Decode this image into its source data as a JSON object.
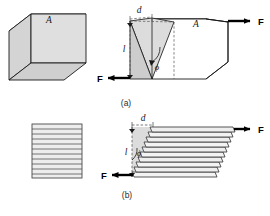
{
  "figure": {
    "background_color": "#ffffff",
    "line_color": "#1a1a1a",
    "face_fill_light": "#e8e8e8",
    "face_fill_mid": "#dedede",
    "face_fill_dark": "#d0d0d0",
    "face_fill_white": "#ffffff",
    "dash_color": "#555555",
    "width": 270,
    "height": 216
  },
  "panels": [
    {
      "id": "a",
      "caption": "(a)",
      "undeformed": {
        "area_label": "A",
        "description": "undeformed cube"
      },
      "deformed": {
        "area_label": "A",
        "displacement_label": "d",
        "height_label": "l",
        "angle_label": "ϕ",
        "force_label_top": "F",
        "force_label_bottom": "F",
        "description": "sheared cube"
      }
    },
    {
      "id": "b",
      "caption": "(b)",
      "undeformed": {
        "layer_count": 11,
        "description": "stack of undeformed layers"
      },
      "deformed": {
        "displacement_label": "d",
        "height_label": "l",
        "angle_label": "ϕ",
        "force_label_top": "F",
        "force_label_bottom": "F",
        "layer_count": 11,
        "description": "sheared stack of layers"
      }
    }
  ],
  "labels": {
    "A": "A",
    "d": "d",
    "l": "l",
    "phi": "ϕ",
    "F": "F",
    "caption_a": "(a)",
    "caption_b": "(b)"
  }
}
